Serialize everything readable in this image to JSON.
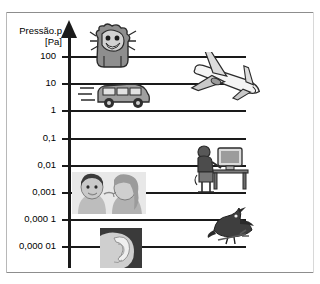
{
  "figure": {
    "axis_title": "Pressão.p",
    "axis_unit": "[Pa]",
    "axis_name": "pressure-axis",
    "accent_color": "#1a1a1a",
    "frame_color": "#8d8d8d"
  },
  "chart_data": {
    "type": "bar",
    "title": "Pressão.p [Pa]",
    "xlabel": "",
    "ylabel": "Pressão.p [Pa]",
    "scale": "log10",
    "grid": true,
    "legend": "none",
    "categories": [
      "100",
      "10",
      "1",
      "0,1",
      "0,01",
      "0,001",
      "0,000 1",
      "0,000 01"
    ],
    "values": [
      100,
      10,
      1,
      0.1,
      0.01,
      0.001,
      0.0001,
      1e-05
    ],
    "ylim": [
      1e-05,
      100
    ],
    "tick_labels": [
      "100",
      "10",
      "1",
      "0,1",
      "0,01",
      "0,001",
      "0,000 1",
      "0,000 01"
    ],
    "annotations": [
      {
        "label": "shouting-person",
        "value": 100
      },
      {
        "label": "airplane",
        "value": 10
      },
      {
        "label": "car",
        "value": 1
      },
      {
        "label": "person-at-computer",
        "value": 0.01
      },
      {
        "label": "whispering-women",
        "value": 0.001
      },
      {
        "label": "bird",
        "value": 0.0001
      },
      {
        "label": "ear",
        "value": 1e-05
      }
    ]
  },
  "ticks": [
    {
      "label": "100",
      "top": 57,
      "grid_width": 175
    },
    {
      "label": "10",
      "top": 84,
      "grid_width": 175
    },
    {
      "label": "1",
      "top": 111,
      "grid_width": 175
    },
    {
      "label": "0,1",
      "top": 139,
      "grid_width": 175
    },
    {
      "label": "0,01",
      "top": 166,
      "grid_width": 175
    },
    {
      "label": "0,001",
      "top": 193,
      "grid_width": 175
    },
    {
      "label": "0,000 1",
      "top": 220,
      "grid_width": 175
    },
    {
      "label": "0,000 01",
      "top": 247,
      "grid_width": 175
    }
  ],
  "pictures": [
    {
      "name": "shouting-person-illustration",
      "alt": "shouting person"
    },
    {
      "name": "airplane-illustration",
      "alt": "airplane taking off"
    },
    {
      "name": "car-illustration",
      "alt": "moving car"
    },
    {
      "name": "person-at-computer-illustration",
      "alt": "person working at computer"
    },
    {
      "name": "whispering-women-photo",
      "alt": "two women whispering"
    },
    {
      "name": "bird-illustration",
      "alt": "bird on a branch"
    },
    {
      "name": "ear-photo",
      "alt": "close-up of a human ear"
    }
  ]
}
